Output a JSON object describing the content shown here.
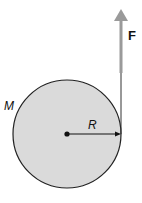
{
  "diagram": {
    "type": "physics-free-body",
    "labels": {
      "force": "F",
      "mass": "M",
      "radius": "R"
    },
    "colors": {
      "disk_fill": "#d9d9d9",
      "disk_stroke": "#222222",
      "force_arrow": "#9a9a9a",
      "string": "#333333"
    }
  }
}
